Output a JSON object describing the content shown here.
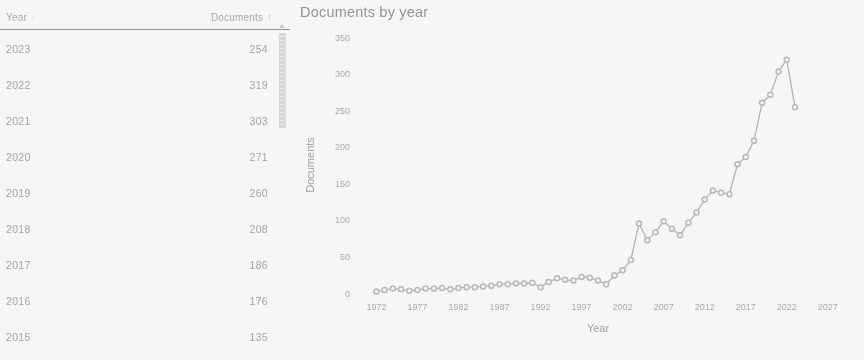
{
  "table": {
    "columns": [
      {
        "label": "Year",
        "sort_icon": "sort-descending-arrow",
        "sort_glyph": "↓"
      },
      {
        "label": "Documents",
        "sort_icon": "sort-ascending-arrow",
        "sort_glyph": "↑"
      }
    ],
    "rows": [
      {
        "year": "2023",
        "documents": "254"
      },
      {
        "year": "2022",
        "documents": "319"
      },
      {
        "year": "2021",
        "documents": "303"
      },
      {
        "year": "2020",
        "documents": "271"
      },
      {
        "year": "2019",
        "documents": "260"
      },
      {
        "year": "2018",
        "documents": "208"
      },
      {
        "year": "2017",
        "documents": "186"
      },
      {
        "year": "2016",
        "documents": "176"
      },
      {
        "year": "2015",
        "documents": "135"
      }
    ],
    "scrollbar": {
      "thumb_position": "top"
    }
  },
  "chart_data": {
    "type": "line",
    "title": "Documents by year",
    "xlabel": "Year",
    "ylabel": "Documents",
    "xlim": [
      1970,
      2028
    ],
    "ylim": [
      0,
      350
    ],
    "xticks": [
      1972,
      1977,
      1982,
      1987,
      1992,
      1997,
      2002,
      2007,
      2012,
      2017,
      2022,
      2027
    ],
    "yticks": [
      0,
      50,
      100,
      150,
      200,
      250,
      300,
      350
    ],
    "grid": false,
    "legend": "none",
    "marker": "circle",
    "line_color": "#b3b3b3",
    "marker_color": "#b8b8b8",
    "x": [
      1972,
      1973,
      1974,
      1975,
      1976,
      1977,
      1978,
      1979,
      1980,
      1981,
      1982,
      1983,
      1984,
      1985,
      1986,
      1987,
      1988,
      1989,
      1990,
      1991,
      1992,
      1993,
      1994,
      1995,
      1996,
      1997,
      1998,
      1999,
      2000,
      2001,
      2002,
      2003,
      2004,
      2005,
      2006,
      2007,
      2008,
      2009,
      2010,
      2011,
      2012,
      2013,
      2014,
      2015,
      2016,
      2017,
      2018,
      2019,
      2020,
      2021,
      2022,
      2023
    ],
    "values": [
      2,
      4,
      6,
      5,
      3,
      4,
      6,
      6,
      7,
      5,
      7,
      8,
      8,
      9,
      10,
      12,
      12,
      13,
      13,
      14,
      8,
      15,
      20,
      18,
      17,
      22,
      21,
      17,
      12,
      24,
      31,
      45,
      95,
      72,
      83,
      98,
      88,
      79,
      96,
      110,
      128,
      140,
      137,
      135,
      176,
      186,
      208,
      260,
      271,
      303,
      319,
      254
    ]
  }
}
